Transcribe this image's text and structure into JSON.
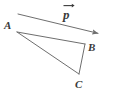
{
  "figure": {
    "kind": "geometry-vector-triangle-diagram",
    "background_color": "#ffffff",
    "stroke_color": "#6e6e6e",
    "label_color": "#3a3a3a",
    "stroke_width": 1,
    "canvas": {
      "width": 116,
      "height": 96
    },
    "vertices": [
      {
        "id": "A",
        "label": "A",
        "x": 17,
        "y": 32
      },
      {
        "id": "B",
        "label": "B",
        "x": 85,
        "y": 44
      },
      {
        "id": "C",
        "label": "C",
        "x": 79,
        "y": 74
      }
    ],
    "edges": [
      {
        "id": "AB",
        "from": "A",
        "to": "B"
      },
      {
        "id": "AC",
        "from": "A",
        "to": "C"
      },
      {
        "id": "BC",
        "from": "B",
        "to": "C"
      }
    ],
    "vector": {
      "label": "p",
      "label_accent": "arrow-right",
      "start_x": 18,
      "start_y": 14,
      "end_x": 101,
      "end_y": 34,
      "arrowhead": "filled-triangle"
    }
  }
}
